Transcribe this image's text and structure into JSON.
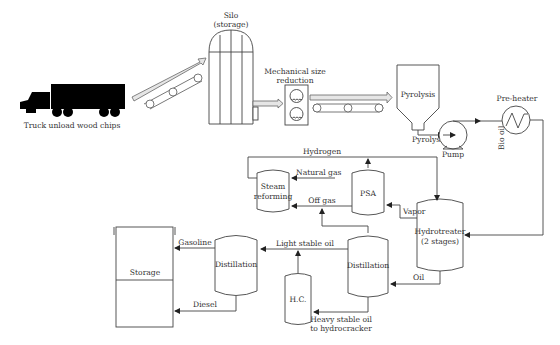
{
  "diagram": {
    "colors": {
      "line": "#444444",
      "text": "#333333",
      "truck": "#000000",
      "arrow_fill": "#e6e6e6",
      "background": "#ffffff"
    },
    "units": {
      "truck": {
        "label": "Truck unload wood chips",
        "icon": "truck-icon"
      },
      "silo": {
        "label_line1": "Silo",
        "label_line2": "(storage)",
        "icon": "silo-icon"
      },
      "size_reduction": {
        "label_line1": "Mechanical size",
        "label_line2": "reduction",
        "icon": "grinder-icon"
      },
      "pyrolysis": {
        "label": "Pyrolysis",
        "icon": "hopper-reactor-icon"
      },
      "pump": {
        "label": "Pump",
        "icon": "pump-icon"
      },
      "preheater": {
        "label": "Pre-heater",
        "icon": "heat-exchanger-icon"
      },
      "hydrotreater": {
        "label_line1": "Hydrotreater",
        "label_line2": "(2 stages)"
      },
      "psa": {
        "label": "PSA"
      },
      "steam_reforming": {
        "label_line1": "Steam",
        "label_line2": "reforming"
      },
      "distillation_main": {
        "label": "Distillation"
      },
      "distillation_light": {
        "label": "Distillation"
      },
      "hydrocracker": {
        "label": "H.C."
      },
      "storage": {
        "label": "Storage"
      }
    },
    "streams": {
      "pyrolysis_oil": "Pyrolysis oil",
      "bio_oil": "Bio oil",
      "hydrogen": "Hydrogen",
      "natural_gas": "Natural gas",
      "off_gas": "Off gas",
      "vapor": "Vapor",
      "oil": "Oil",
      "light_stable_oil": "Light stable oil",
      "heavy_line1": "Heavy stable oil",
      "heavy_line2": "to hydrocracker",
      "gasoline": "Gasoline",
      "diesel": "Diesel"
    }
  }
}
